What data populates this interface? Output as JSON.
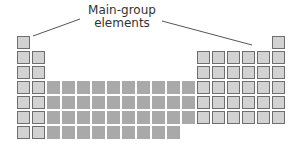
{
  "diagram": {
    "type": "periodic-table-schematic",
    "callout": {
      "line1": "Main-group",
      "line2": "elements"
    },
    "colors": {
      "main_group_fill": "#d2d2d2",
      "main_group_border": "#6e6e6e",
      "transition_fill": "#a9a9a9",
      "callout_line": "#555555"
    },
    "grid": {
      "origin_x": 17,
      "origin_y": 36,
      "pitch": 15,
      "rows": [
        {
          "row": 1,
          "s_block": 1,
          "d_block": 0,
          "p_block": 1
        },
        {
          "row": 2,
          "s_block": 2,
          "d_block": 0,
          "p_block": 6
        },
        {
          "row": 3,
          "s_block": 2,
          "d_block": 0,
          "p_block": 6
        },
        {
          "row": 4,
          "s_block": 2,
          "d_block": 10,
          "p_block": 6
        },
        {
          "row": 5,
          "s_block": 2,
          "d_block": 10,
          "p_block": 6
        },
        {
          "row": 6,
          "s_block": 2,
          "d_block": 10,
          "p_block": 6
        },
        {
          "row": 7,
          "s_block": 2,
          "d_block": 9,
          "p_block": 0
        }
      ]
    }
  }
}
